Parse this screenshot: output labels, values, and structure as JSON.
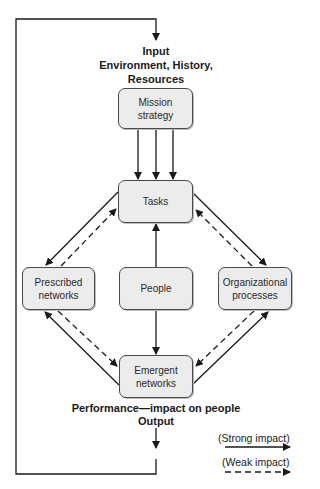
{
  "diagram": {
    "input_label": "Input\nEnvironment, History,\nResources",
    "output_label_line1": "Performance—impact on people",
    "output_label_line2": "Output",
    "nodes": {
      "mission": "Mission\nstrategy",
      "tasks": "Tasks",
      "prescribed": "Prescribed\nnetworks",
      "people": "People",
      "organizational": "Organizational\nprocesses",
      "emergent": "Emergent\nnetworks"
    },
    "edges": [
      {
        "from": "mission",
        "to": "tasks",
        "type": "strong",
        "count": 3
      },
      {
        "from": "people",
        "to": "tasks",
        "type": "strong"
      },
      {
        "from": "people",
        "to": "emergent",
        "type": "strong"
      },
      {
        "from": "tasks",
        "to": "prescribed",
        "type": "strong"
      },
      {
        "from": "prescribed",
        "to": "tasks",
        "type": "weak"
      },
      {
        "from": "tasks",
        "to": "organizational",
        "type": "strong"
      },
      {
        "from": "organizational",
        "to": "tasks",
        "type": "weak"
      },
      {
        "from": "emergent",
        "to": "prescribed",
        "type": "strong"
      },
      {
        "from": "prescribed",
        "to": "emergent",
        "type": "weak"
      },
      {
        "from": "emergent",
        "to": "organizational",
        "type": "strong"
      },
      {
        "from": "organizational",
        "to": "emergent",
        "type": "weak"
      },
      {
        "from": "output",
        "to": "input",
        "type": "strong",
        "note": "feedback loop"
      }
    ],
    "legend": {
      "strong": "(Strong impact)",
      "weak": "(Weak impact)"
    },
    "colors": {
      "box_fill": "#ececec",
      "box_border": "#4a4a4a",
      "line": "#1a1a1a"
    }
  }
}
